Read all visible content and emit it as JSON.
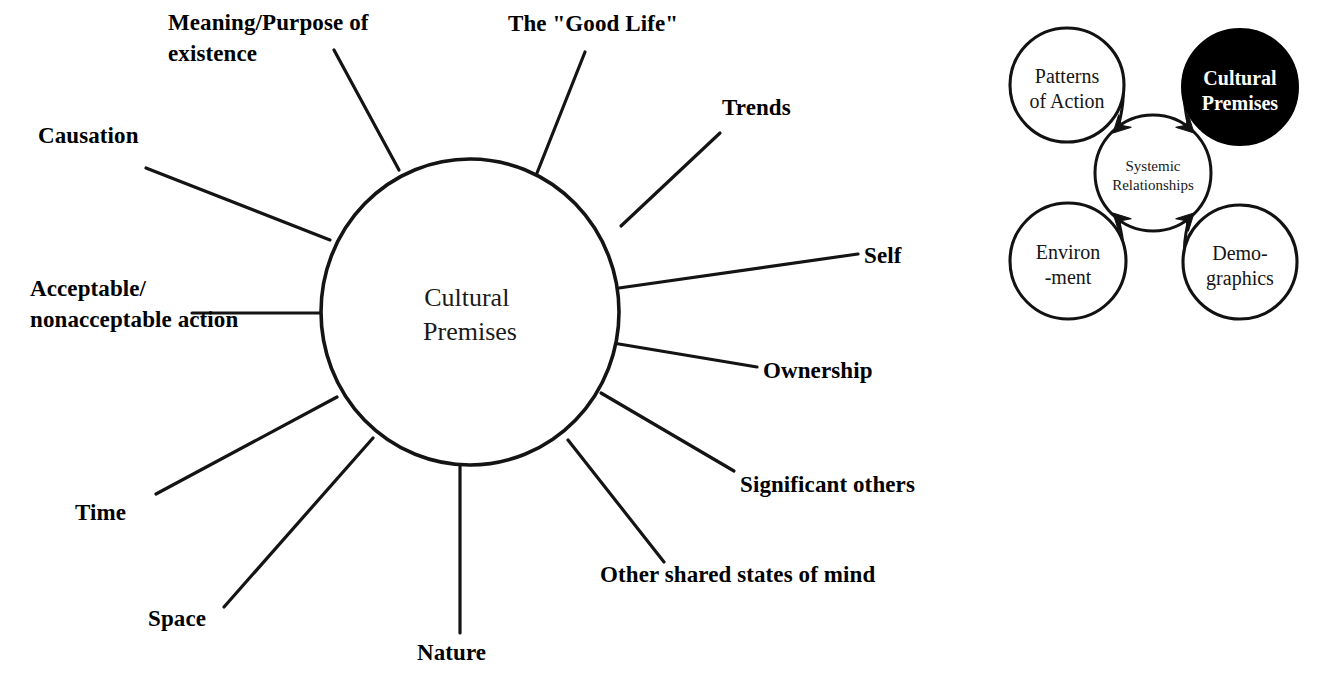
{
  "document": {
    "title": "Cultural Premises",
    "background_color": "#ffffff",
    "ink_color": "#111111"
  },
  "main_diagram": {
    "name": "cultural-premises-radial-diagram",
    "hub": {
      "label_line_1": "Cultural",
      "label_line_2": "Premises",
      "center_x": 470,
      "center_y": 312,
      "radius_x": 149,
      "radius_y": 153
    },
    "spokes": [
      {
        "id": "meaning-purpose-of-existence",
        "label_lines": [
          "Meaning/Purpose of",
          "existence"
        ],
        "label_x": 168,
        "label_y": 30,
        "line": {
          "x1": 334,
          "y1": 50,
          "x2": 399,
          "y2": 170
        }
      },
      {
        "id": "the-good-life",
        "label_lines": [
          "The \"Good Life\""
        ],
        "label_x": 508,
        "label_y": 31,
        "line": {
          "x1": 585,
          "y1": 52,
          "x2": 537,
          "y2": 173
        }
      },
      {
        "id": "trends",
        "label_lines": [
          "Trends"
        ],
        "label_x": 722,
        "label_y": 115,
        "line": {
          "x1": 720,
          "y1": 133,
          "x2": 621,
          "y2": 226
        }
      },
      {
        "id": "self",
        "label_lines": [
          "Self"
        ],
        "label_x": 864,
        "label_y": 263,
        "line": {
          "x1": 858,
          "y1": 254,
          "x2": 619,
          "y2": 288
        }
      },
      {
        "id": "ownership",
        "label_lines": [
          "Ownership"
        ],
        "label_x": 763,
        "label_y": 378,
        "line": {
          "x1": 757,
          "y1": 367,
          "x2": 613,
          "y2": 343
        }
      },
      {
        "id": "significant-others",
        "label_lines": [
          "Significant others"
        ],
        "label_x": 740,
        "label_y": 492,
        "line": {
          "x1": 734,
          "y1": 471,
          "x2": 601,
          "y2": 393
        }
      },
      {
        "id": "other-shared-states-of-mind",
        "label_lines": [
          "Other shared states of mind"
        ],
        "label_x": 600,
        "label_y": 582,
        "line": {
          "x1": 664,
          "y1": 562,
          "x2": 568,
          "y2": 440
        }
      },
      {
        "id": "nature",
        "label_lines": [
          "Nature"
        ],
        "label_x": 417,
        "label_y": 660,
        "line": {
          "x1": 460,
          "y1": 633,
          "x2": 460,
          "y2": 464
        }
      },
      {
        "id": "space",
        "label_lines": [
          "Space"
        ],
        "label_x": 148,
        "label_y": 626,
        "line": {
          "x1": 224,
          "y1": 607,
          "x2": 373,
          "y2": 438
        }
      },
      {
        "id": "time",
        "label_lines": [
          "Time"
        ],
        "label_x": 75,
        "label_y": 520,
        "line": {
          "x1": 156,
          "y1": 494,
          "x2": 337,
          "y2": 397
        }
      },
      {
        "id": "acceptable-nonacceptable-action",
        "label_lines": [
          "Acceptable/",
          "nonacceptable action"
        ],
        "label_x": 30,
        "label_y": 296,
        "line": {
          "x1": 192,
          "y1": 313,
          "x2": 322,
          "y2": 313
        }
      },
      {
        "id": "causation",
        "label_lines": [
          "Causation"
        ],
        "label_x": 38,
        "label_y": 143,
        "line": {
          "x1": 146,
          "y1": 168,
          "x2": 330,
          "y2": 240
        }
      }
    ]
  },
  "inset_diagram": {
    "name": "systemic-relationships-diagram",
    "center_circle": {
      "id": "systemic-relationships",
      "label_lines": [
        "Systemic",
        "Relationships"
      ],
      "cx": 1153,
      "cy": 173,
      "r": 58,
      "fill": "#ffffff",
      "text_color": "#181818"
    },
    "outer_circles": [
      {
        "id": "patterns-of-action",
        "label_lines": [
          "Patterns",
          "of Action"
        ],
        "cx": 1067,
        "cy": 85,
        "r": 57,
        "fill": "#ffffff",
        "text_color": "#151515",
        "highlighted": false
      },
      {
        "id": "cultural-premises",
        "label_lines": [
          "Cultural",
          "Premises"
        ],
        "cx": 1240,
        "cy": 87,
        "r": 58,
        "fill": "#000000",
        "text_color": "#ffffff",
        "highlighted": true
      },
      {
        "id": "environment",
        "label_lines": [
          "Environ",
          "-ment"
        ],
        "cx": 1068,
        "cy": 261,
        "r": 58,
        "fill": "#ffffff",
        "text_color": "#151515",
        "highlighted": false
      },
      {
        "id": "demographics",
        "label_lines": [
          "Demo-",
          "graphics"
        ],
        "cx": 1240,
        "cy": 262,
        "r": 57,
        "fill": "#ffffff",
        "text_color": "#151515",
        "highlighted": false
      }
    ],
    "arrow_count": 4,
    "arrow_direction": "inward-to-center"
  }
}
